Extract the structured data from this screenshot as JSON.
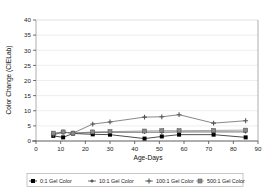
{
  "chart_data": {
    "type": "line",
    "title": "",
    "xlabel": "Age-Days",
    "ylabel": "Color Change (CIELab)",
    "xlim": [
      0,
      90
    ],
    "ylim": [
      0,
      40
    ],
    "xticks": [
      0,
      10,
      20,
      30,
      40,
      50,
      60,
      70,
      80,
      90
    ],
    "yticks": [
      0,
      5,
      10,
      15,
      20,
      25,
      30,
      35,
      40
    ],
    "grid": "horizontal",
    "legend_position": "bottom",
    "x": [
      7,
      11,
      15,
      23,
      30,
      44,
      51,
      58,
      72,
      85
    ],
    "series": [
      {
        "name": "0:1 Gel Color",
        "marker": "filled-square",
        "color": "#000000",
        "values": [
          1.7,
          1.2,
          2.5,
          2.2,
          2.1,
          0.8,
          1.5,
          2.1,
          2.1,
          1.2
        ]
      },
      {
        "name": "10:1 Gel Color",
        "marker": "small-plus",
        "color": "#333333",
        "values": [
          2.4,
          2.9,
          2.6,
          2.8,
          2.9,
          2.9,
          2.9,
          3.0,
          3.0,
          3.0
        ]
      },
      {
        "name": "100:1 Gel Color",
        "marker": "plus",
        "color": "#555555",
        "values": [
          2.0,
          2.9,
          2.6,
          5.6,
          6.3,
          7.9,
          8.0,
          8.7,
          5.9,
          6.7
        ]
      },
      {
        "name": "500:1 Gel Color",
        "marker": "gray-square",
        "color": "#808080",
        "values": [
          2.6,
          3.0,
          2.6,
          3.0,
          3.1,
          3.3,
          3.4,
          3.4,
          3.5,
          3.6
        ]
      }
    ]
  },
  "axes": {
    "y_title": "Color Change (CIELab)",
    "x_title": "Age-Days",
    "y_tick_labels": [
      "0",
      "5",
      "10",
      "15",
      "20",
      "25",
      "30",
      "35",
      "40"
    ],
    "x_tick_labels": [
      "0",
      "10",
      "20",
      "30",
      "40",
      "50",
      "60",
      "70",
      "80",
      "90"
    ]
  },
  "legend": {
    "items": [
      {
        "label": "0:1 Gel Color",
        "icon": "filled-square-marker"
      },
      {
        "label": "10:1 Gel Color",
        "icon": "small-plus-marker"
      },
      {
        "label": "100:1 Gel Color",
        "icon": "plus-marker"
      },
      {
        "label": "500:1 Gel Color",
        "icon": "dash-marker"
      }
    ]
  },
  "colors": {
    "axis": "#4d4d4d",
    "grid": "#e2e2e2",
    "frame": "#9a9a9a",
    "series_dark": "#000000",
    "series_mid": "#555555",
    "series_gray": "#808080",
    "legend_border": "#b0b0b0"
  }
}
